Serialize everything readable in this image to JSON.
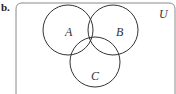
{
  "figure": {
    "part_label": "b.",
    "universe_label": "U",
    "sets": [
      {
        "name": "A",
        "label": "A",
        "cx": 68,
        "cy": 30,
        "r": 25
      },
      {
        "name": "B",
        "label": "B",
        "cx": 113,
        "cy": 30,
        "r": 25
      },
      {
        "name": "C",
        "label": "C",
        "cx": 95,
        "cy": 62,
        "r": 25
      }
    ],
    "shaded_region": "A ∩ B ∩ C",
    "colors": {
      "stroke": "#333333",
      "frame": "#8a8a8a",
      "shade": "#cfcfcf",
      "background": "#ffffff"
    }
  }
}
